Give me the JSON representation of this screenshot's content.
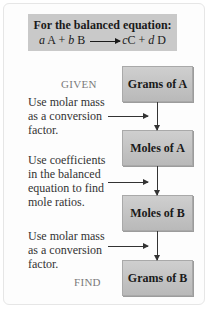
{
  "header": {
    "title": "For the balanced equation:",
    "equation": {
      "a": "a",
      "A": "A",
      "plus1": "+",
      "b": "b",
      "B": "B",
      "c": "c",
      "C": "C",
      "plus2": "+",
      "d": "d",
      "D": "D"
    }
  },
  "labels": {
    "given": "GIVEN",
    "find": "FIND"
  },
  "boxes": [
    {
      "label": "Grams of A"
    },
    {
      "label": "Moles of A"
    },
    {
      "label": "Moles of B"
    },
    {
      "label": "Grams of B"
    }
  ],
  "notes": [
    {
      "lines": [
        "Use molar mass",
        "as a conversion",
        "factor."
      ]
    },
    {
      "lines": [
        "Use coefficients",
        "in the balanced",
        "equation to find",
        "mole ratios."
      ]
    },
    {
      "lines": [
        "Use molar mass",
        "as a conversion",
        "factor."
      ]
    }
  ],
  "colors": {
    "box_fill": "#c4c4c4",
    "header_fill": "#c9c9c9",
    "label_gray": "#7a7a7a"
  }
}
